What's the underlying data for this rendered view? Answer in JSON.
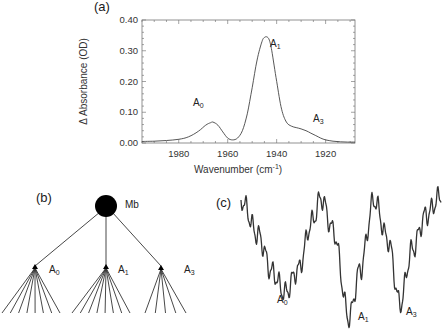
{
  "figure": {
    "panels": {
      "a": {
        "label": "(a)"
      },
      "b": {
        "label": "(b)",
        "root": "Mb",
        "children": [
          {
            "name": "A",
            "sub": "0",
            "branches": 8
          },
          {
            "name": "A",
            "sub": "1",
            "branches": 8
          },
          {
            "name": "A",
            "sub": "3",
            "branches": 5
          }
        ]
      },
      "c": {
        "label": "(c)",
        "minima": [
          {
            "name": "A",
            "sub": "0"
          },
          {
            "name": "A",
            "sub": "1"
          },
          {
            "name": "A",
            "sub": "3"
          }
        ]
      }
    }
  },
  "chart_data": {
    "type": "line",
    "title": "",
    "xlabel": "Wavenumber (cm",
    "xlabel_sup": "-1",
    "xlabel_close": ")",
    "ylabel": "Δ Absorbance (OD)",
    "xlim": [
      1995,
      1908
    ],
    "ylim": [
      0.0,
      0.4
    ],
    "x_ticks": [
      "1980",
      "1960",
      "1940",
      "1920"
    ],
    "y_ticks": [
      "0.00",
      "0.10",
      "0.20",
      "0.30",
      "0.40"
    ],
    "grid": false,
    "legend": null,
    "annotations": [
      {
        "text": "A",
        "sub": "0",
        "x": 1966,
        "y": 0.068
      },
      {
        "text": "A",
        "sub": "1",
        "x": 1944,
        "y": 0.345
      },
      {
        "text": "A",
        "sub": "3",
        "x": 1932,
        "y": 0.045
      }
    ],
    "series": [
      {
        "name": "spectrum",
        "x": [
          1995,
          1990,
          1985,
          1980,
          1976,
          1972,
          1969,
          1967,
          1966,
          1964,
          1962,
          1960,
          1958,
          1956,
          1954,
          1952,
          1950,
          1948,
          1946,
          1945,
          1944,
          1943,
          1942,
          1940,
          1938,
          1936,
          1934,
          1932,
          1930,
          1928,
          1926,
          1924,
          1922,
          1920,
          1917,
          1914,
          1911,
          1908
        ],
        "values": [
          0.005,
          0.006,
          0.008,
          0.012,
          0.02,
          0.038,
          0.058,
          0.066,
          0.068,
          0.058,
          0.036,
          0.016,
          0.01,
          0.016,
          0.04,
          0.095,
          0.18,
          0.27,
          0.33,
          0.343,
          0.345,
          0.335,
          0.3,
          0.2,
          0.11,
          0.068,
          0.055,
          0.05,
          0.046,
          0.04,
          0.032,
          0.024,
          0.016,
          0.01,
          0.006,
          0.004,
          0.003,
          0.003
        ]
      }
    ]
  }
}
